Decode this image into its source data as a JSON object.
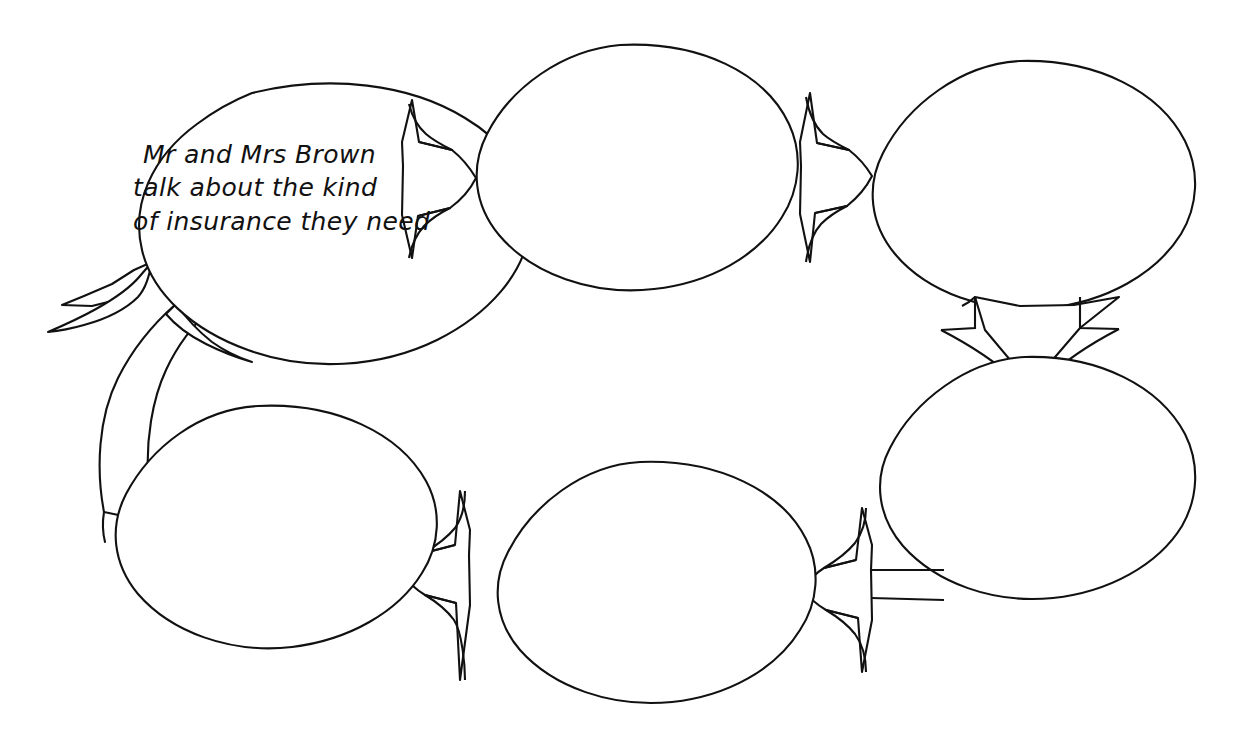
{
  "page": {
    "background_color": "#ffffff",
    "ink_color": "#111111",
    "style": "hand-drawn black ink line art on white paper"
  },
  "diagram": {
    "type": "cycle-flow",
    "shape": "speech-bubble-ellipse",
    "node_count": 6,
    "filled_node_count": 1,
    "blank_node_count": 5,
    "direction": "clockwise",
    "nodes": [
      {
        "id": "node-1",
        "position": "top-left",
        "text_lines": [
          "Mr and Mrs Brown",
          "talk about the kind",
          "of insurance they need"
        ],
        "filled": "true"
      },
      {
        "id": "node-2",
        "position": "top-middle",
        "text_lines": [],
        "filled": "false"
      },
      {
        "id": "node-3",
        "position": "top-right",
        "text_lines": [],
        "filled": "false"
      },
      {
        "id": "node-4",
        "position": "bottom-right",
        "text_lines": [],
        "filled": "false"
      },
      {
        "id": "node-5",
        "position": "bottom-middle",
        "text_lines": [],
        "filled": "false"
      },
      {
        "id": "node-6",
        "position": "bottom-left",
        "text_lines": [],
        "filled": "false"
      }
    ],
    "connectors": [
      {
        "id": "arrow-1",
        "from": "node-1",
        "to": "node-2",
        "direction": "right"
      },
      {
        "id": "arrow-2",
        "from": "node-2",
        "to": "node-3",
        "direction": "right"
      },
      {
        "id": "arrow-3",
        "from": "node-3",
        "to": "node-4",
        "direction": "down"
      },
      {
        "id": "arrow-4",
        "from": "node-4",
        "to": "node-5",
        "direction": "left"
      },
      {
        "id": "arrow-5",
        "from": "node-5",
        "to": "node-6",
        "direction": "left"
      },
      {
        "id": "arrow-6",
        "from": "node-6",
        "to": "node-1",
        "direction": "up-curved"
      }
    ]
  }
}
